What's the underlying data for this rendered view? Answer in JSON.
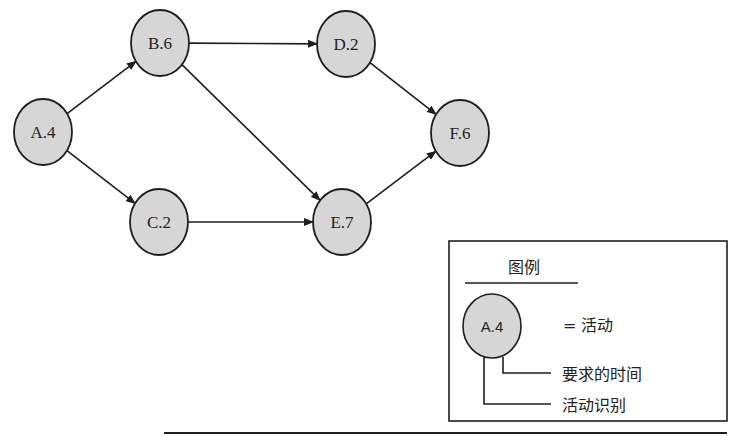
{
  "diagram": {
    "type": "activity-network",
    "nodes": [
      {
        "id": "A",
        "label": "A.4",
        "cx": 43,
        "cy": 132
      },
      {
        "id": "B",
        "label": "B.6",
        "cx": 160,
        "cy": 43
      },
      {
        "id": "C",
        "label": "C.2",
        "cx": 159,
        "cy": 222
      },
      {
        "id": "D",
        "label": "D.2",
        "cx": 346,
        "cy": 44
      },
      {
        "id": "E",
        "label": "E.7",
        "cx": 342,
        "cy": 222
      },
      {
        "id": "F",
        "label": "F.6",
        "cx": 460,
        "cy": 133
      }
    ],
    "edges": [
      {
        "from": "A",
        "to": "B"
      },
      {
        "from": "A",
        "to": "C"
      },
      {
        "from": "B",
        "to": "D"
      },
      {
        "from": "B",
        "to": "E"
      },
      {
        "from": "C",
        "to": "E"
      },
      {
        "from": "D",
        "to": "F"
      },
      {
        "from": "E",
        "to": "F"
      }
    ],
    "colors": {
      "node_fill": "#d6d6d6",
      "stroke": "#1e1e1e"
    }
  },
  "legend": {
    "title": "图例",
    "sample_node_label": "A.4",
    "equals_text": "= 活动",
    "time_label": "要求的时间",
    "id_label": "活动识别"
  }
}
